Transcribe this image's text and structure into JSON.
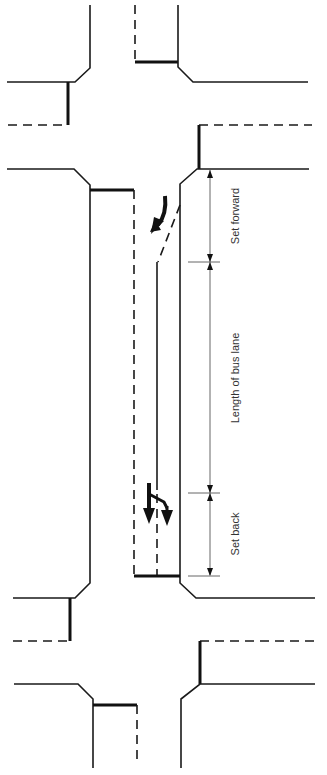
{
  "diagram": {
    "type": "road-layout",
    "colors": {
      "line": "#1a1a1a",
      "dimension": "#666666",
      "text": "#333333",
      "background": "#ffffff"
    },
    "dimensions": [
      {
        "id": "set-forward",
        "label": "Set forward",
        "y_start": 169,
        "y_end": 262
      },
      {
        "id": "length-of-bus-lane",
        "label": "Length of bus lane",
        "y_start": 262,
        "y_end": 493
      },
      {
        "id": "set-back",
        "label": "Set back",
        "y_start": 493,
        "y_end": 576
      }
    ],
    "arrows": [
      {
        "id": "merge-arrow",
        "meaning": "traffic merging in at start of bus lane"
      },
      {
        "id": "split-arrow",
        "meaning": "lane splitting back to two lanes after bus lane"
      }
    ]
  }
}
